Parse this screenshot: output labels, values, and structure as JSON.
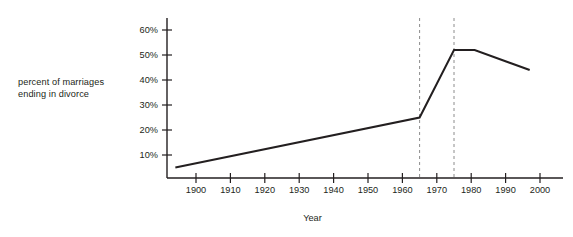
{
  "chart_data": {
    "type": "line",
    "title": "",
    "subtitle": "",
    "xlabel": "Year",
    "ylabel": "percent of marriages\nending in divorce",
    "ylabel_line1": "percent of marriages",
    "ylabel_line2": "ending in divorce",
    "grid": false,
    "legend": false,
    "legend_position": "none",
    "xlim": [
      1894,
      2003
    ],
    "ylim": [
      0,
      65
    ],
    "xticks": [
      1900,
      1910,
      1920,
      1930,
      1940,
      1950,
      1960,
      1970,
      1980,
      1990,
      2000
    ],
    "xtick_labels": [
      "1900",
      "1910",
      "1920",
      "1930",
      "1940",
      "1950",
      "1960",
      "1970",
      "1980",
      "1990",
      "2000"
    ],
    "yticks": [
      10,
      20,
      30,
      40,
      50,
      60
    ],
    "ytick_labels": [
      "10%",
      "20%",
      "30%",
      "40%",
      "50%",
      "60%"
    ],
    "series": [
      {
        "name": "percent of marriages ending in divorce",
        "color": "#231f20",
        "x": [
          1894,
          1965,
          1975,
          1981,
          1997
        ],
        "values": [
          5,
          25,
          52,
          52,
          44
        ]
      }
    ],
    "annotations": [
      {
        "type": "vertical-dashed-line",
        "x": 1965,
        "color": "#8c8c8c",
        "label": ""
      },
      {
        "type": "vertical-dashed-line",
        "x": 1975,
        "color": "#8c8c8c",
        "label": ""
      }
    ],
    "axis_color": "#231f20",
    "line_color": "#231f20",
    "dashed_line_color": "#8c8c8c",
    "background_color": "#ffffff"
  }
}
